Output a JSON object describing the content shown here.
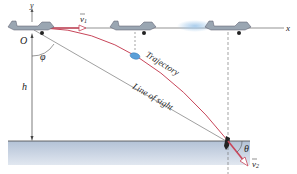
{
  "axes": {
    "x_label": "x",
    "y_label": "y",
    "origin_label": "O"
  },
  "labels": {
    "v1": "v",
    "v1_sub": "1",
    "v2": "v",
    "v2_sub": "2",
    "phi": "φ",
    "theta": "θ",
    "h": "h",
    "trajectory": "Trajectory",
    "line_of_sight": "Line of sight"
  },
  "colors": {
    "trajectory": "#c8465a",
    "velocity_arrow": "#c8465a",
    "line_of_sight": "#888888",
    "water_top": "#b9c7d8",
    "water_bottom": "#dde4ee",
    "plane_body": "#9aa6b2",
    "capsule": "#5b9fd8"
  }
}
